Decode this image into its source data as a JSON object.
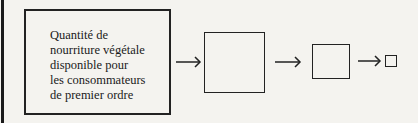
{
  "diagram": {
    "type": "flow",
    "boxes": [
      {
        "id": "box1",
        "lines": [
          "Quantité de",
          "nourriture végétale",
          "disponible pour",
          "les consommateurs",
          "de premier ordre"
        ]
      },
      {
        "id": "box2",
        "lines": []
      },
      {
        "id": "box3",
        "lines": []
      },
      {
        "id": "box4",
        "lines": []
      }
    ],
    "edges": [
      {
        "from": "box1",
        "to": "box2"
      },
      {
        "from": "box2",
        "to": "box3"
      },
      {
        "from": "box3",
        "to": "box4"
      }
    ]
  }
}
